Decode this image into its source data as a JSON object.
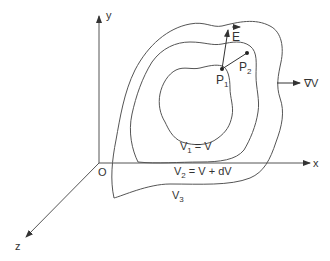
{
  "diagram": {
    "axes": {
      "x_label": "x",
      "y_label": "y",
      "z_label": "z",
      "origin_label": "O"
    },
    "surfaces": [
      {
        "id": "V1",
        "label_main": "V",
        "label_sub": "1",
        "label_rest": " = V"
      },
      {
        "id": "V2",
        "label_main": "V",
        "label_sub": "2",
        "label_rest": " = V + dV"
      },
      {
        "id": "V3",
        "label_main": "V",
        "label_sub": "3",
        "label_rest": ""
      }
    ],
    "points": [
      {
        "id": "P1",
        "label_main": "P",
        "label_sub": "1"
      },
      {
        "id": "P2",
        "label_main": "P",
        "label_sub": "2"
      }
    ],
    "vectors": {
      "field": "E",
      "gradient": "∇V"
    },
    "colors": {
      "line": "#555555",
      "text": "#333333",
      "background": "#ffffff"
    }
  }
}
